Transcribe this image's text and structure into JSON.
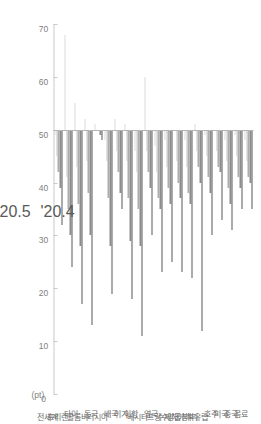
{
  "chart_data": {
    "type": "bar",
    "orientation": "horizontal-rotated",
    "title": "",
    "xlabel": "",
    "ylabel": "",
    "unit_label": "(pt)",
    "axis_ticks": [
      70,
      60,
      50,
      40,
      30,
      20,
      10,
      0
    ],
    "axis_reversed": true,
    "ylim": [
      0,
      70
    ],
    "baseline": 50,
    "grid": false,
    "legend_position": "left",
    "legend": [
      "'20.4",
      "'20.5",
      "'20.6",
      "'20.7",
      "'20.8"
    ],
    "series_colors": [
      "#585858",
      "#8c8c8c",
      "#adadad",
      "#c6c6c6",
      "#dcdcdc"
    ],
    "categories": [
      "음료",
      "중국",
      "미국",
      "호주",
      "북유럽",
      "이태리",
      "양곱창",
      "수제해",
      "프랑수",
      "영국",
      "베시타",
      "이항",
      "이가",
      "배국",
      "러시아",
      "동국",
      "콜롬비",
      "타이",
      "프리랜",
      "전세계"
    ],
    "series": [
      {
        "name": "'20.4",
        "values": [
          35,
          35,
          31,
          33,
          30,
          12,
          22,
          23,
          25,
          23,
          30,
          11,
          18,
          35,
          19,
          48,
          13,
          17,
          24,
          32
        ]
      },
      {
        "name": "'20.5",
        "values": [
          40,
          39,
          36,
          42,
          38,
          40,
          36,
          37,
          36,
          35,
          39,
          28,
          29,
          38,
          28,
          49,
          30,
          28,
          30,
          39
        ]
      },
      {
        "name": "'20.6",
        "values": [
          41,
          41,
          39,
          43,
          41,
          43,
          38,
          40,
          39,
          37,
          42,
          35,
          37,
          42,
          37,
          50,
          38,
          36,
          35,
          42
        ]
      },
      {
        "name": "'20.7",
        "values": [
          44,
          45,
          44,
          46,
          45,
          46,
          43,
          44,
          43,
          42,
          46,
          42,
          44,
          46,
          44,
          50,
          44,
          43,
          41,
          45
        ]
      },
      {
        "name": "'20.8",
        "values": [
          48,
          49,
          48,
          50,
          49,
          51,
          48,
          50,
          48,
          47,
          60,
          46,
          51,
          52,
          48,
          51,
          52,
          55,
          68,
          49
        ]
      }
    ]
  }
}
